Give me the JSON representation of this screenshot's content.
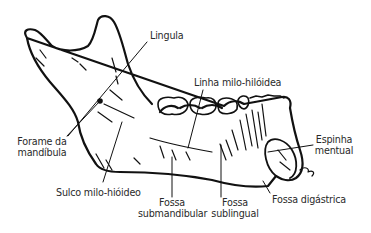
{
  "diagram": {
    "labels": {
      "lingula": "Lingula",
      "linha_milo": "Linha milo-hilóidea",
      "forame_l1": "Forame da",
      "forame_l2": "mandíbula",
      "sulco": "Sulco milo-hióideo",
      "espinha_l1": "Espinha",
      "espinha_l2": "mentual",
      "fossa_sub_l1": "Fossa",
      "fossa_sub_l2": "submandibular",
      "fossa_subl_l1": "Fossa",
      "fossa_subl_l2": "sublingual",
      "fossa_dig": "Fossa digástrica"
    },
    "colors": {
      "ink": "#111111",
      "text": "#2a2a2a",
      "background": "#ffffff"
    }
  }
}
